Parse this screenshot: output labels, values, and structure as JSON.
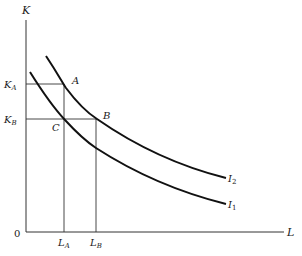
{
  "diagram": {
    "type": "isoquant",
    "axes": {
      "x_label": "L",
      "y_label": "K",
      "origin_label": "0"
    },
    "ticks": {
      "x": [
        {
          "label": "L",
          "sub": "A"
        },
        {
          "label": "L",
          "sub": "B"
        }
      ],
      "y": [
        {
          "label": "K",
          "sub": "A"
        },
        {
          "label": "K",
          "sub": "B"
        }
      ]
    },
    "points": [
      {
        "label": "A"
      },
      {
        "label": "B"
      },
      {
        "label": "C"
      }
    ],
    "curves": [
      {
        "label": "I",
        "sub": "2"
      },
      {
        "label": "I",
        "sub": "1"
      }
    ]
  }
}
